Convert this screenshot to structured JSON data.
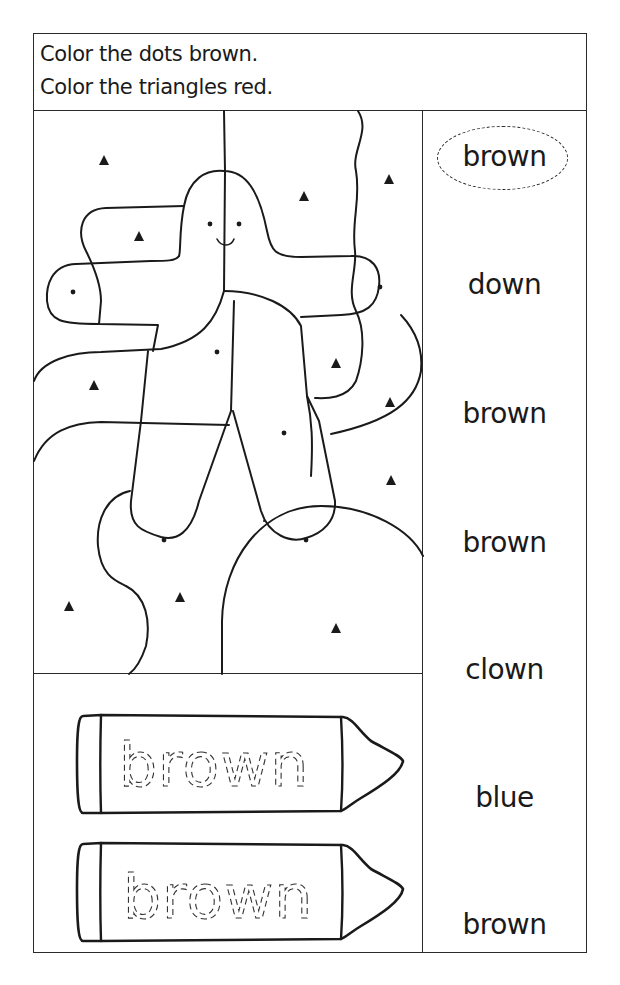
{
  "header": {
    "instructions": [
      "Color the dots brown.",
      "Color the triangles red."
    ]
  },
  "picture": {
    "description": "gingerbread-like figure hidden among shapes with dots and triangles",
    "dot_count": 7,
    "triangle_count": 13,
    "colors": {
      "dots": "brown",
      "triangles": "red"
    }
  },
  "crayons": [
    {
      "trace_word": "brown"
    },
    {
      "trace_word": "brown"
    }
  ],
  "word_list": {
    "words": [
      {
        "text": "brown",
        "circled": true
      },
      {
        "text": "down",
        "circled": false
      },
      {
        "text": "brown",
        "circled": false
      },
      {
        "text": "brown",
        "circled": false
      },
      {
        "text": "clown",
        "circled": false
      },
      {
        "text": "blue",
        "circled": false
      },
      {
        "text": "brown",
        "circled": false
      }
    ]
  },
  "colors": {
    "ink": "#1a1a1a",
    "paper": "#ffffff"
  }
}
